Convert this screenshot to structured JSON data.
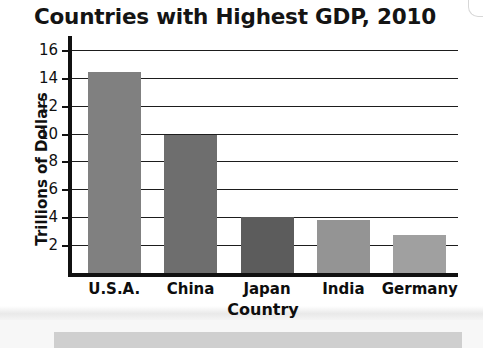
{
  "chart_data": {
    "type": "bar",
    "title": "Countries with Highest GDP, 2010",
    "xlabel": "Country",
    "ylabel": "Trillions of Dollars",
    "categories": [
      "U.S.A.",
      "China",
      "Japan",
      "India",
      "Germany"
    ],
    "values": [
      14.4,
      9.9,
      4.0,
      3.8,
      2.7
    ],
    "bar_colors": [
      "#808080",
      "#6e6e6e",
      "#5c5c5c",
      "#949494",
      "#a0a0a0"
    ],
    "ylim": [
      0,
      17
    ],
    "yticks": [
      2,
      4,
      6,
      8,
      10,
      12,
      14,
      16
    ],
    "ytick_labels": [
      "2",
      "4",
      "6",
      "8",
      "10",
      "12",
      "14",
      "16"
    ],
    "grid": true,
    "grid_axis": "y",
    "legend": false,
    "axis_color": "#111111",
    "background": "#ffffff"
  },
  "page": {
    "strip_color": "#cfcfcf"
  }
}
